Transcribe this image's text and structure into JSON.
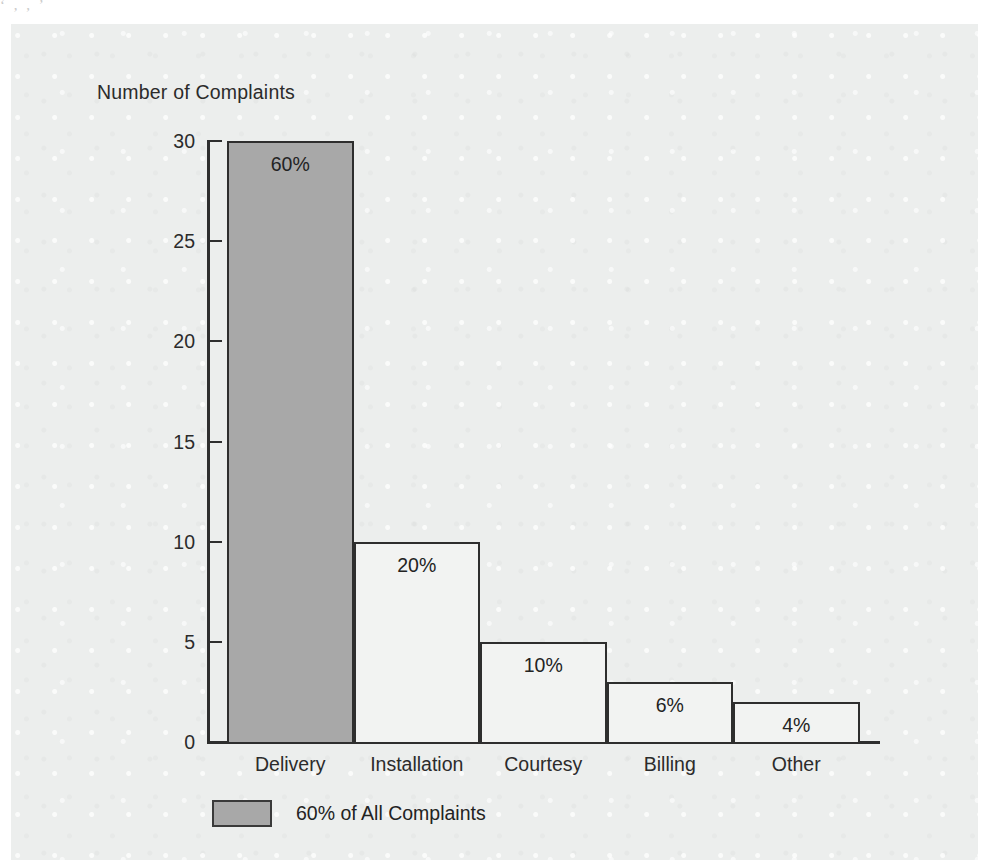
{
  "figure": {
    "background_color": "#eceeed",
    "axis_color": "#2e2e2e",
    "bar_fill_color": "#f2f3f2",
    "highlight_color": "#a8a8a8",
    "top_sliver_text": "ʻ  ,  ,  ʼ"
  },
  "legend": {
    "label": "60% of All Complaints",
    "swatch_color": "#a8a8a8"
  },
  "chart_data": {
    "type": "bar",
    "title": "",
    "xlabel": "",
    "ylabel": "Number of Complaints",
    "categories": [
      "Delivery",
      "Installation",
      "Courtesy",
      "Billing",
      "Other"
    ],
    "values": [
      30,
      10,
      5,
      3,
      2
    ],
    "data_labels": [
      "60%",
      "20%",
      "10%",
      "6%",
      "4%"
    ],
    "bar_colors": [
      "#a8a8a8",
      "#f2f3f2",
      "#f2f3f2",
      "#f2f3f2",
      "#f2f3f2"
    ],
    "highlighted_categories": [
      "Delivery"
    ],
    "ylim": [
      0,
      30
    ],
    "yticks": [
      0,
      5,
      10,
      15,
      20,
      25,
      30
    ],
    "ytick_labels": [
      "0",
      "5",
      "10",
      "15",
      "20",
      "25",
      "30"
    ],
    "grid": false,
    "legend_position": "below-left",
    "legend_entries": [
      {
        "label": "60% of All Complaints",
        "color": "#a8a8a8"
      }
    ]
  }
}
